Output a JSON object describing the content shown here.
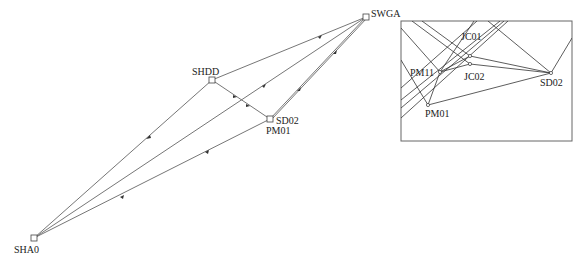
{
  "diagram": {
    "type": "survey-network",
    "stations": [
      {
        "id": "SHA0",
        "label": "SHA0",
        "x": 34,
        "y": 238
      },
      {
        "id": "SHDD",
        "label": "SHDD",
        "x": 212,
        "y": 80
      },
      {
        "id": "SD02",
        "label": "SD02",
        "x": 270,
        "y": 119
      },
      {
        "id": "PM01",
        "label": "PM01",
        "x": 270,
        "y": 119
      },
      {
        "id": "SWGA",
        "label": "SWGA",
        "x": 366,
        "y": 17
      }
    ],
    "edges": [
      [
        "SHA0",
        "SHDD"
      ],
      [
        "SHA0",
        "SWGA"
      ],
      [
        "SHA0",
        "SD02"
      ],
      [
        "SHDD",
        "SWGA"
      ],
      [
        "SHDD",
        "SD02"
      ],
      [
        "SD02",
        "SWGA"
      ]
    ],
    "labels": {
      "sha0": "SHA0",
      "shdd": "SHDD",
      "sd02": "SD02",
      "pm01": "PM01",
      "swga": "SWGA"
    },
    "inset": {
      "labels": {
        "jc01": "JC01",
        "jc02": "JC02",
        "pm11": "PM11",
        "pm01": "PM01",
        "sd02": "SD02"
      },
      "points": {
        "JC01": [
          470,
          56
        ],
        "JC02": [
          470,
          64
        ],
        "PM11": [
          440,
          72
        ],
        "PM01": [
          428,
          105
        ],
        "SD02": [
          551,
          73
        ]
      }
    },
    "colors": {
      "line": "#555555",
      "inset_line": "#333333",
      "border": "#666666"
    }
  }
}
